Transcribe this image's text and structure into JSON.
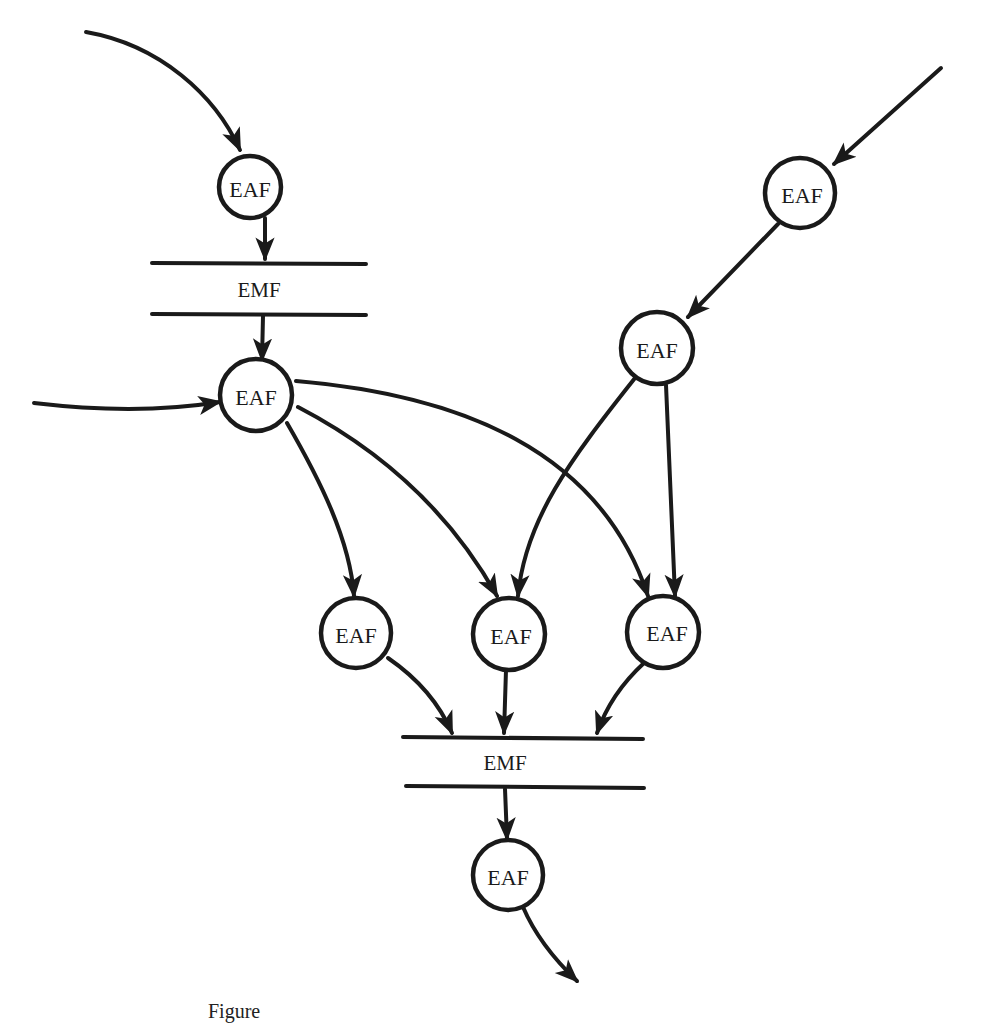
{
  "diagram": {
    "type": "data-flow",
    "stroke_color": "#1a1a1a",
    "background": "#ffffff",
    "nodes": [
      {
        "id": "eaf-top-left",
        "kind": "process",
        "label": "EAF",
        "x": 250,
        "y": 187
      },
      {
        "id": "emf-upper",
        "kind": "store",
        "label": "EMF",
        "x1": 150,
        "x2": 367,
        "y_top": 263,
        "y_bottom": 314
      },
      {
        "id": "eaf-mid-left",
        "kind": "process",
        "label": "EAF",
        "x": 256,
        "y": 395
      },
      {
        "id": "eaf-top-right",
        "kind": "process",
        "label": "EAF",
        "x": 800,
        "y": 193
      },
      {
        "id": "eaf-mid-right",
        "kind": "process",
        "label": "EAF",
        "x": 657,
        "y": 348
      },
      {
        "id": "eaf-row-1",
        "kind": "process",
        "label": "EAF",
        "x": 356,
        "y": 633
      },
      {
        "id": "eaf-row-2",
        "kind": "process",
        "label": "EAF",
        "x": 509,
        "y": 634
      },
      {
        "id": "eaf-row-3",
        "kind": "process",
        "label": "EAF",
        "x": 663,
        "y": 632
      },
      {
        "id": "emf-lower",
        "kind": "store",
        "label": "EMF",
        "x1": 402,
        "x2": 643,
        "y_top": 738,
        "y_bottom": 787
      },
      {
        "id": "eaf-bottom",
        "kind": "process",
        "label": "EAF",
        "x": 508,
        "y": 875
      }
    ],
    "edges": [
      {
        "from": "external-in-top-left",
        "to": "eaf-top-left"
      },
      {
        "from": "eaf-top-left",
        "to": "emf-upper"
      },
      {
        "from": "emf-upper",
        "to": "eaf-mid-left"
      },
      {
        "from": "external-in-left",
        "to": "eaf-mid-left"
      },
      {
        "from": "external-in-top-right",
        "to": "eaf-top-right"
      },
      {
        "from": "eaf-top-right",
        "to": "eaf-mid-right"
      },
      {
        "from": "eaf-mid-left",
        "to": "eaf-row-1"
      },
      {
        "from": "eaf-mid-left",
        "to": "eaf-row-2"
      },
      {
        "from": "eaf-mid-left",
        "to": "eaf-row-3"
      },
      {
        "from": "eaf-mid-right",
        "to": "eaf-row-2"
      },
      {
        "from": "eaf-mid-right",
        "to": "eaf-row-3"
      },
      {
        "from": "eaf-row-1",
        "to": "emf-lower"
      },
      {
        "from": "eaf-row-2",
        "to": "emf-lower"
      },
      {
        "from": "eaf-row-3",
        "to": "emf-lower"
      },
      {
        "from": "emf-lower",
        "to": "eaf-bottom"
      },
      {
        "from": "eaf-bottom",
        "to": "external-out"
      }
    ],
    "caption": "Figure"
  },
  "labels": {
    "eaf": "EAF",
    "emf": "EMF"
  }
}
